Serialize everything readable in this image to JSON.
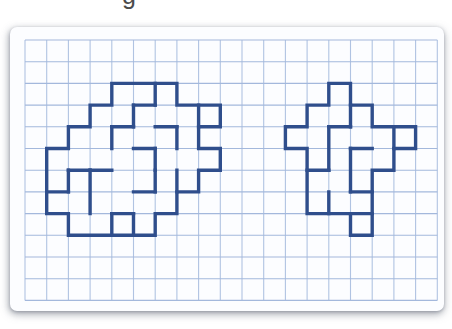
{
  "title_fragment": {
    "text": "g",
    "note": "cropped descender of title text above the visible area"
  },
  "card": {
    "x": 10,
    "y": 27,
    "width": 434,
    "height": 284,
    "background": "#fcfdff"
  },
  "figure": {
    "grid": {
      "unit": 21.7,
      "origin_x": 15,
      "origin_y": 13,
      "cols": 20,
      "rows": 13,
      "h_line_color": "#a3b8dc",
      "v_line_color": "#b0c3e2",
      "line_width": 1.1
    },
    "stroke": {
      "color": "#2f4e8c",
      "width": 3.4
    },
    "shapes": [
      {
        "name": "left-polyomino",
        "outline": [
          [
            4,
            2
          ],
          [
            7,
            2
          ],
          [
            7,
            3
          ],
          [
            9,
            3
          ],
          [
            9,
            4
          ],
          [
            8,
            4
          ],
          [
            8,
            5
          ],
          [
            9,
            5
          ],
          [
            9,
            6
          ],
          [
            8,
            6
          ],
          [
            8,
            7
          ],
          [
            7,
            7
          ],
          [
            7,
            8
          ],
          [
            6,
            8
          ],
          [
            6,
            9
          ],
          [
            2,
            9
          ],
          [
            2,
            8
          ],
          [
            1,
            8
          ],
          [
            1,
            5
          ],
          [
            2,
            5
          ],
          [
            2,
            4
          ],
          [
            3,
            4
          ],
          [
            3,
            3
          ],
          [
            4,
            3
          ]
        ],
        "internal": [
          [
            6,
            2,
            6,
            3
          ],
          [
            5,
            3,
            6,
            3
          ],
          [
            5,
            3,
            5,
            4
          ],
          [
            4,
            4,
            5,
            4
          ],
          [
            4,
            4,
            4,
            5
          ],
          [
            6,
            4,
            7,
            4
          ],
          [
            7,
            4,
            7,
            5
          ],
          [
            8,
            3,
            8,
            4
          ],
          [
            5,
            5,
            6,
            5
          ],
          [
            6,
            5,
            6,
            6
          ],
          [
            3,
            6,
            4,
            6
          ],
          [
            2,
            6,
            3,
            6
          ],
          [
            2,
            6,
            2,
            7
          ],
          [
            3,
            6,
            3,
            8
          ],
          [
            1,
            7,
            2,
            7
          ],
          [
            4,
            8,
            5,
            8
          ],
          [
            4,
            8,
            4,
            9
          ],
          [
            5,
            8,
            5,
            9
          ],
          [
            5,
            7,
            6,
            7
          ],
          [
            6,
            6,
            6,
            7
          ],
          [
            7,
            6,
            7,
            7
          ]
        ]
      },
      {
        "name": "right-polyomino",
        "outline": [
          [
            14,
            2
          ],
          [
            15,
            2
          ],
          [
            15,
            3
          ],
          [
            16,
            3
          ],
          [
            16,
            4
          ],
          [
            18,
            4
          ],
          [
            18,
            5
          ],
          [
            17,
            5
          ],
          [
            17,
            6
          ],
          [
            16,
            6
          ],
          [
            16,
            9
          ],
          [
            15,
            9
          ],
          [
            15,
            8
          ],
          [
            13,
            8
          ],
          [
            13,
            5
          ],
          [
            12,
            5
          ],
          [
            12,
            4
          ],
          [
            13,
            4
          ],
          [
            13,
            3
          ],
          [
            14,
            3
          ]
        ],
        "internal": [
          [
            15,
            3,
            15,
            4
          ],
          [
            14,
            4,
            15,
            4
          ],
          [
            14,
            4,
            14,
            6
          ],
          [
            17,
            4,
            17,
            5
          ],
          [
            15,
            5,
            16,
            5
          ],
          [
            15,
            5,
            15,
            7
          ],
          [
            13,
            6,
            14,
            6
          ],
          [
            15,
            7,
            16,
            7
          ],
          [
            14,
            7,
            14,
            8
          ],
          [
            15,
            8,
            16,
            8
          ]
        ]
      }
    ]
  }
}
